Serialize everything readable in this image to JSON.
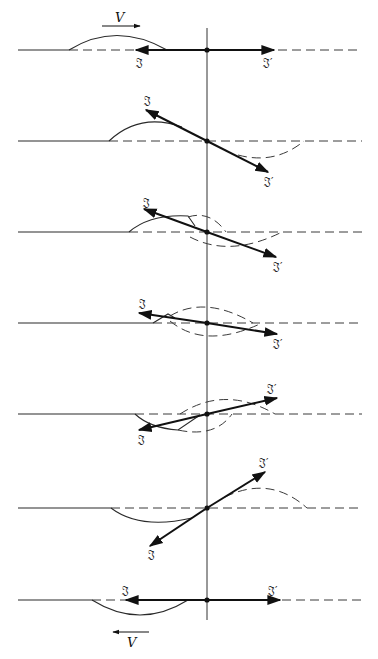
{
  "figure": {
    "velocity_label": "V",
    "vector_labels": {
      "incident": "𝔍",
      "reflected": "𝔍′"
    },
    "axis_x": 207,
    "axis_top": 28,
    "axis_bottom": 620,
    "line_left": 18,
    "line_right": 362,
    "colors": {
      "ink": "#111111",
      "background": "#ffffff"
    }
  },
  "panels": [
    {
      "id": 1,
      "baseline": 50,
      "angle_deg": 0,
      "label_J": "𝔍",
      "label_Jp": "𝔍′",
      "velocity": "right"
    },
    {
      "id": 2,
      "baseline": 141,
      "angle_deg": -30,
      "label_J": "𝔍",
      "label_Jp": "𝔍′"
    },
    {
      "id": 3,
      "baseline": 232,
      "angle_deg": -20,
      "label_J": "𝔍",
      "label_Jp": "𝔍′"
    },
    {
      "id": 4,
      "baseline": 323,
      "angle_deg": -8,
      "label_J": "𝔍",
      "label_Jp": "𝔍′"
    },
    {
      "id": 5,
      "baseline": 414,
      "angle_deg": 14,
      "label_J": "𝔍",
      "label_Jp": "𝔍′"
    },
    {
      "id": 6,
      "baseline": 508,
      "angle_deg": 37,
      "label_J": "𝔍",
      "label_Jp": "𝔍′"
    },
    {
      "id": 7,
      "baseline": 600,
      "angle_deg": 0,
      "label_J": "𝔍",
      "label_Jp": "𝔍′",
      "velocity": "left"
    }
  ]
}
